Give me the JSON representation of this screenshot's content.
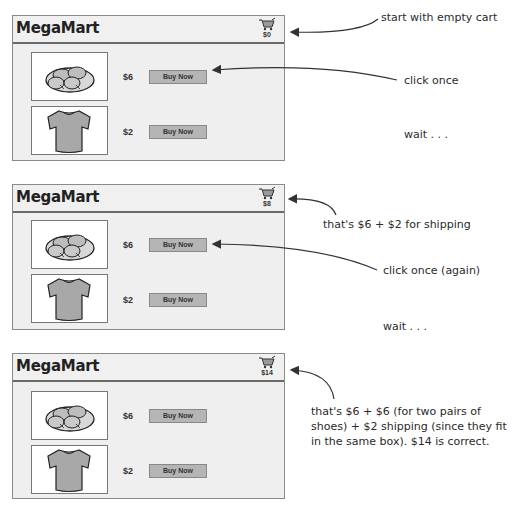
{
  "app_title": "MegaMart",
  "frames": [
    {
      "cart_total": "$0",
      "items": [
        {
          "name": "shoes",
          "price": "$6",
          "button": "Buy Now"
        },
        {
          "name": "t-shirt",
          "price": "$2",
          "button": "Buy Now"
        }
      ],
      "notes": {
        "cart": "start with empty cart",
        "click": "click once",
        "wait": "wait . . ."
      }
    },
    {
      "cart_total": "$8",
      "items": [
        {
          "name": "shoes",
          "price": "$6",
          "button": "Buy Now"
        },
        {
          "name": "t-shirt",
          "price": "$2",
          "button": "Buy Now"
        }
      ],
      "notes": {
        "cart": "that's $6 + $2 for shipping",
        "click": "click once (again)",
        "wait": "wait . . ."
      }
    },
    {
      "cart_total": "$14",
      "items": [
        {
          "name": "shoes",
          "price": "$6",
          "button": "Buy Now"
        },
        {
          "name": "t-shirt",
          "price": "$2",
          "button": "Buy Now"
        }
      ],
      "notes": {
        "cart": "that's $6 + $6 (for two pairs of shoes) + $2 shipping (since they fit in the same box). $14 is correct."
      }
    }
  ],
  "colors": {
    "frame_bg": "#efefef",
    "button_bg": "#b5b5b5",
    "shirt_fill": "#a8a8a8",
    "border": "#8a8a8a"
  }
}
